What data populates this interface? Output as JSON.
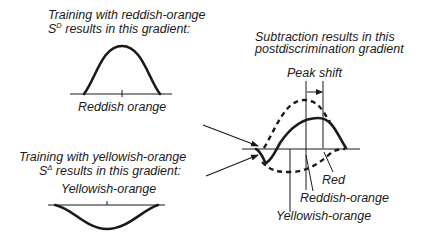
{
  "panel_sd": {
    "caption_line1": "Training with reddish-orange",
    "caption_line2_prefix": "S",
    "caption_line2_sup": "D",
    "caption_line2_suffix": " results in this gradient:",
    "axis_label": "Reddish orange",
    "curve": "excitatory-gradient-peak"
  },
  "panel_sdelta": {
    "caption_line1": "Training with yellowish-orange",
    "caption_line2_prefix": "S",
    "caption_line2_sup": "Δ",
    "caption_line2_suffix": " results in this gradient:",
    "axis_label": "Yellowish-orange",
    "curve": "inhibitory-gradient-trough"
  },
  "panel_result": {
    "caption_line1": "Subtraction results in this",
    "caption_line2": "postdiscrimination gradient",
    "peak_shift_label": "Peak shift",
    "labels": {
      "red": "Red",
      "reddish_orange": "Reddish-orange",
      "yellowish_orange": "Yellowish-orange"
    }
  },
  "colors": {
    "ink": "#1a1a1a",
    "background": "#ffffff"
  }
}
